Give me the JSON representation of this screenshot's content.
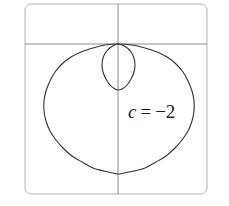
{
  "figure": {
    "name": "limacon-curve-plot",
    "label": {
      "variable": "c",
      "equals": "=",
      "value": "−2",
      "full_text": "c = −2"
    },
    "colors": {
      "curve": "#333333",
      "axis": "#8c8c8c",
      "frame": "#b3b3b3",
      "background": "#ffffff",
      "label_text": "#1a1a1a"
    }
  },
  "chart_data": {
    "type": "line",
    "title": "",
    "xlabel": "",
    "ylabel": "",
    "curve_name": "limacon",
    "equation": "r = 1 + c·sinθ",
    "parameter": {
      "symbol": "c",
      "value": -2
    },
    "annotations": [
      {
        "text": "c = −2",
        "x_px": 128,
        "y_px": 118
      }
    ],
    "grid": false,
    "legend_position": "none",
    "axes": {
      "vertical_axis_x_px": 118,
      "horizontal_axis_y_px": 44,
      "frame_rect_px": {
        "x": 25,
        "y": 4,
        "width": 182,
        "height": 190
      },
      "frame_corner_radius_px": 6
    },
    "features": {
      "node_point_px": {
        "x": 118,
        "y": 44
      },
      "outer_loop_extent_px": {
        "left": 44,
        "right": 193,
        "top": 44,
        "bottom": 174
      },
      "inner_loop_extent_px": {
        "left": 102,
        "right": 135,
        "top": 44,
        "bottom": 90
      }
    },
    "series": [
      {
        "name": "outer-loop",
        "points_px": [
          [
            118,
            44
          ],
          [
            105,
            45
          ],
          [
            93,
            48
          ],
          [
            81,
            52
          ],
          [
            71,
            57
          ],
          [
            62,
            64
          ],
          [
            55,
            72
          ],
          [
            50,
            81
          ],
          [
            46,
            91
          ],
          [
            44,
            101
          ],
          [
            44,
            111
          ],
          [
            46,
            121
          ],
          [
            50,
            131
          ],
          [
            56,
            140
          ],
          [
            63,
            148
          ],
          [
            72,
            156
          ],
          [
            82,
            162
          ],
          [
            93,
            168
          ],
          [
            104,
            171
          ],
          [
            113,
            173
          ],
          [
            118,
            174
          ],
          [
            124,
            173
          ],
          [
            134,
            171
          ],
          [
            145,
            168
          ],
          [
            156,
            162
          ],
          [
            166,
            156
          ],
          [
            175,
            148
          ],
          [
            182,
            140
          ],
          [
            188,
            131
          ],
          [
            192,
            121
          ],
          [
            194,
            111
          ],
          [
            194,
            101
          ],
          [
            192,
            91
          ],
          [
            188,
            81
          ],
          [
            183,
            72
          ],
          [
            176,
            64
          ],
          [
            167,
            57
          ],
          [
            157,
            52
          ],
          [
            145,
            48
          ],
          [
            132,
            45
          ],
          [
            118,
            44
          ]
        ]
      },
      {
        "name": "inner-loop",
        "points_px": [
          [
            118,
            44
          ],
          [
            111,
            47
          ],
          [
            106,
            52
          ],
          [
            103,
            58
          ],
          [
            102,
            65
          ],
          [
            103,
            72
          ],
          [
            106,
            79
          ],
          [
            110,
            85
          ],
          [
            115,
            89
          ],
          [
            118,
            90
          ],
          [
            122,
            89
          ],
          [
            127,
            85
          ],
          [
            131,
            79
          ],
          [
            134,
            72
          ],
          [
            135,
            65
          ],
          [
            134,
            58
          ],
          [
            131,
            52
          ],
          [
            126,
            47
          ],
          [
            118,
            44
          ]
        ]
      }
    ]
  }
}
